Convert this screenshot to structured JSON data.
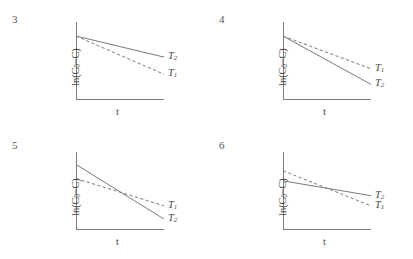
{
  "figure": {
    "axis_labels": {
      "y_prefix": "ln(C",
      "y_sub": "0",
      "y_suffix": "−C)",
      "x": "t"
    },
    "series_symbol": "T",
    "line_color": "#7a7a7a",
    "axis_color": "#7d7d7d",
    "text_color": "#4a4a4a"
  },
  "chart_data": [
    {
      "type": "line",
      "panel": "3",
      "title": "",
      "xlabel": "t",
      "ylabel": "ln(C0−C)",
      "xlim": [
        0,
        100
      ],
      "ylim": [
        0,
        100
      ],
      "grid": false,
      "shared_intercept": true,
      "lines_cross": false,
      "legend_position": "right-of-line-ends",
      "series": [
        {
          "name": "T2",
          "label_sub": "2",
          "style": "solid",
          "x": [
            0,
            100
          ],
          "values": [
            82,
            55
          ],
          "label_y": 55
        },
        {
          "name": "T1",
          "label_sub": "1",
          "style": "dashed",
          "x": [
            0,
            100
          ],
          "values": [
            82,
            33
          ],
          "label_y": 33
        }
      ]
    },
    {
      "type": "line",
      "panel": "4",
      "title": "",
      "xlabel": "t",
      "ylabel": "ln(C0−C)",
      "xlim": [
        0,
        100
      ],
      "ylim": [
        0,
        100
      ],
      "grid": false,
      "shared_intercept": true,
      "lines_cross": false,
      "legend_position": "right-of-line-ends",
      "series": [
        {
          "name": "T1",
          "label_sub": "1",
          "style": "dashed",
          "x": [
            0,
            100
          ],
          "values": [
            82,
            40
          ],
          "label_y": 40
        },
        {
          "name": "T2",
          "label_sub": "2",
          "style": "solid",
          "x": [
            0,
            100
          ],
          "values": [
            82,
            20
          ],
          "label_y": 20
        }
      ]
    },
    {
      "type": "line",
      "panel": "5",
      "title": "",
      "xlabel": "t",
      "ylabel": "ln(C0−C)",
      "xlim": [
        0,
        100
      ],
      "ylim": [
        0,
        100
      ],
      "grid": false,
      "shared_intercept": false,
      "lines_cross": true,
      "crossing_x": 52,
      "legend_position": "right-of-line-ends",
      "series": [
        {
          "name": "T1",
          "label_sub": "1",
          "style": "dashed",
          "x": [
            0,
            100
          ],
          "values": [
            66,
            31
          ],
          "label_y": 31
        },
        {
          "name": "T2",
          "label_sub": "2",
          "style": "solid",
          "x": [
            0,
            100
          ],
          "values": [
            84,
            14
          ],
          "label_y": 14
        }
      ]
    },
    {
      "type": "line",
      "panel": "6",
      "title": "",
      "xlabel": "t",
      "ylabel": "ln(C0−C)",
      "xlim": [
        0,
        100
      ],
      "ylim": [
        0,
        100
      ],
      "grid": false,
      "shared_intercept": false,
      "lines_cross": true,
      "crossing_x": 62,
      "legend_position": "right-of-line-ends",
      "series": [
        {
          "name": "T2",
          "label_sub": "2",
          "style": "solid",
          "x": [
            0,
            100
          ],
          "values": [
            63,
            44
          ],
          "label_y": 44
        },
        {
          "name": "T1",
          "label_sub": "1",
          "style": "dashed",
          "x": [
            0,
            100
          ],
          "values": [
            76,
            31
          ],
          "label_y": 31
        }
      ]
    }
  ]
}
